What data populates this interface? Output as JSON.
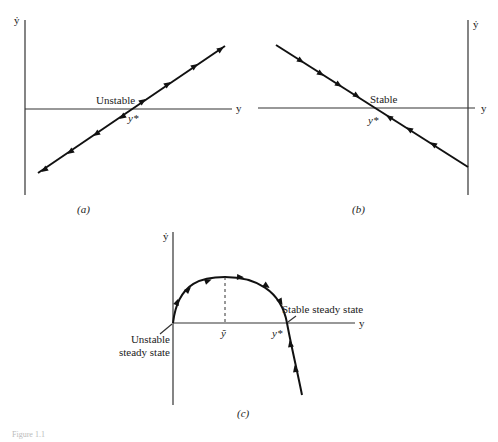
{
  "panels": {
    "a": {
      "caption": "(a)",
      "y_axis_label": "ẏ",
      "x_axis_label": "y",
      "equilibrium_label": "y*",
      "stability_label": "Unstable"
    },
    "b": {
      "caption": "(b)",
      "y_axis_label": "ẏ",
      "x_axis_label": "y",
      "equilibrium_label": "y*",
      "stability_label": "Stable"
    },
    "c": {
      "caption": "(c)",
      "y_axis_label": "ẏ",
      "x_axis_label": "y",
      "peak_label": "ỹ",
      "equilibrium_label": "y*",
      "stable_label": "Stable steady state",
      "unstable_label_line1": "Unstable",
      "unstable_label_line2": "steady state"
    }
  },
  "footer": {
    "figure_label": "Figure 1.1"
  }
}
